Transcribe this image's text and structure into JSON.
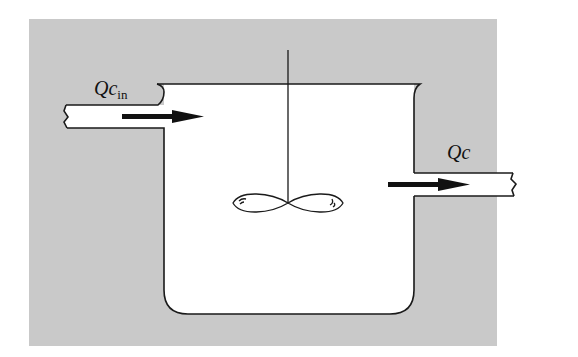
{
  "diagram": {
    "colors": {
      "background": "#c9c9c9",
      "fluid": "#ffffff",
      "stroke": "#1a1a1a",
      "page": "#ffffff"
    },
    "labels": {
      "inflow": {
        "main": "Qc",
        "subscript": "in"
      },
      "outflow": {
        "main": "Qc"
      }
    },
    "components": [
      {
        "id": "inlet-pipe",
        "kind": "pipe",
        "direction": "right"
      },
      {
        "id": "tank",
        "kind": "vessel"
      },
      {
        "id": "stirrer",
        "kind": "impeller",
        "shaft": "vertical"
      },
      {
        "id": "outlet-pipe",
        "kind": "pipe",
        "direction": "right"
      }
    ],
    "arrows": [
      {
        "id": "inflow-arrow",
        "from": "inlet-pipe",
        "to": "tank"
      },
      {
        "id": "outflow-arrow",
        "from": "tank",
        "to": "outlet-pipe"
      }
    ]
  }
}
